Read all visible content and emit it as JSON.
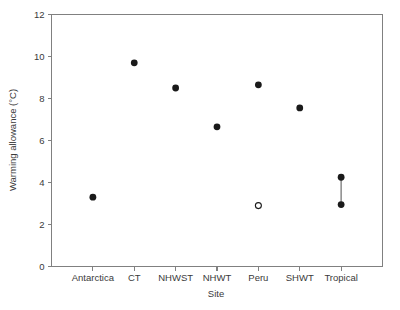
{
  "chart_data": {
    "type": "scatter",
    "title": "",
    "xlabel": "Site",
    "ylabel": "Warming allowance (°C)",
    "categories": [
      "Antarctica",
      "CT",
      "NHWST",
      "NHWT",
      "Peru",
      "SHWT",
      "Tropical"
    ],
    "ylim": [
      0,
      12
    ],
    "yticks": [
      0,
      2,
      4,
      6,
      8,
      10,
      12
    ],
    "yticklabels": [
      "0",
      "2",
      "4",
      "6",
      "8",
      "10",
      "12"
    ],
    "grid": false,
    "legend": null,
    "points": [
      {
        "category": "Antarctica",
        "value": 3.3,
        "marker": "filled"
      },
      {
        "category": "CT",
        "value": 9.7,
        "marker": "filled"
      },
      {
        "category": "NHWST",
        "value": 8.5,
        "marker": "filled"
      },
      {
        "category": "NHWT",
        "value": 6.65,
        "marker": "filled"
      },
      {
        "category": "Peru",
        "value": 8.65,
        "marker": "filled"
      },
      {
        "category": "Peru",
        "value": 2.9,
        "marker": "open"
      },
      {
        "category": "SHWT",
        "value": 7.55,
        "marker": "filled"
      },
      {
        "category": "Tropical",
        "value": 4.25,
        "marker": "filled"
      },
      {
        "category": "Tropical",
        "value": 2.95,
        "marker": "filled"
      }
    ],
    "connectors": [
      {
        "category": "Tropical",
        "from": 2.95,
        "to": 4.25
      }
    ],
    "colors": {
      "marker": "#1a1a1a",
      "axis": "#808080",
      "text": "#3a3a3a",
      "connector": "#777777",
      "background": "#ffffff"
    }
  }
}
